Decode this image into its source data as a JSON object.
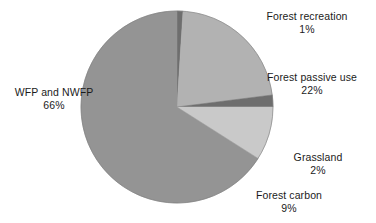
{
  "chart_data": {
    "type": "pie",
    "title": "",
    "subtitle": "",
    "xlabel": "",
    "ylabel": "",
    "legend_position": "none",
    "grid": false,
    "units": "percent",
    "total": 100,
    "categories": [
      "Forest recreation",
      "Forest passive use",
      "Grassland",
      "Forest carbon",
      "WFP and NWFP"
    ],
    "values": [
      1,
      22,
      2,
      9,
      66
    ],
    "labels": [
      "1%",
      "22%",
      "2%",
      "9%",
      "66%"
    ],
    "colors": [
      "#6e6e6e",
      "#b2b2b2",
      "#6e6e6e",
      "#c9c9c9",
      "#949494"
    ],
    "slices": [
      {
        "name": "Forest recreation",
        "value": 1,
        "value_label": "1%",
        "color": "#6e6e6e",
        "start_angle_deg": 0,
        "end_angle_deg": 3.6
      },
      {
        "name": "Forest passive use",
        "value": 22,
        "value_label": "22%",
        "color": "#b2b2b2",
        "start_angle_deg": 3.6,
        "end_angle_deg": 82.8
      },
      {
        "name": "Grassland",
        "value": 2,
        "value_label": "2%",
        "color": "#6e6e6e",
        "start_angle_deg": 82.8,
        "end_angle_deg": 90.0
      },
      {
        "name": "Forest carbon",
        "value": 9,
        "value_label": "9%",
        "color": "#c9c9c9",
        "start_angle_deg": 90.0,
        "end_angle_deg": 122.4
      },
      {
        "name": "WFP and NWFP",
        "value": 66,
        "value_label": "66%",
        "color": "#949494",
        "start_angle_deg": 122.4,
        "end_angle_deg": 360.0
      }
    ],
    "geometry": {
      "center_x": 177,
      "center_y": 107,
      "radius": 96
    }
  },
  "labels": {
    "forest_recreation": {
      "name": "Forest recreation",
      "value": "1%"
    },
    "forest_passive_use": {
      "name": "Forest passive use",
      "value": "22%"
    },
    "wfp_and_nwfp": {
      "name": "WFP and NWFP",
      "value": "66%"
    },
    "grassland": {
      "name": "Grassland",
      "value": "2%"
    },
    "forest_carbon": {
      "name": "Forest carbon",
      "value": "9%"
    }
  },
  "colors": {
    "background": "#ffffff",
    "text": "#1b1b1b",
    "slice_main": "#949494",
    "slice_passive": "#b2b2b2",
    "slice_carbon": "#c9c9c9",
    "slice_sliver": "#6e6e6e",
    "outline": "#7a7a7a"
  }
}
